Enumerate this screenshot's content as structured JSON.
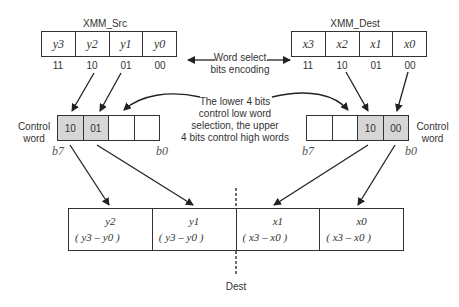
{
  "src_register": {
    "title": "XMM_Src",
    "cells": [
      "y3",
      "y2",
      "y1",
      "y0"
    ],
    "encodings": [
      "11",
      "10",
      "01",
      "00"
    ]
  },
  "dest_register": {
    "title": "XMM_Dest",
    "cells": [
      "x3",
      "x2",
      "x1",
      "x0"
    ],
    "encodings": [
      "11",
      "10",
      "01",
      "00"
    ]
  },
  "annotations": {
    "word_select": [
      "Word select",
      "bits encoding"
    ],
    "lower_upper": [
      "The lower 4 bits",
      "control low word",
      "selection, the upper",
      "4 bits control high words"
    ]
  },
  "control_left": {
    "label": [
      "Control",
      "word"
    ],
    "cells": [
      "10",
      "01",
      "",
      ""
    ],
    "bit_high": "b7",
    "bit_low": "b0"
  },
  "control_right": {
    "label": [
      "Control",
      "word"
    ],
    "cells": [
      "",
      "",
      "10",
      "00"
    ],
    "bit_high": "b7",
    "bit_low": "b0"
  },
  "dest_result": {
    "label": "Dest",
    "cells": [
      {
        "value": "y2",
        "range": "( y3 – y0 )"
      },
      {
        "value": "y1",
        "range": "( y3 – y0 )"
      },
      {
        "value": "x1",
        "range": "( x3 – x0 )"
      },
      {
        "value": "x0",
        "range": "( x3 – x0 )"
      }
    ]
  },
  "colors": {
    "line": "#222222",
    "selected_cell": "#d6d6d6"
  }
}
